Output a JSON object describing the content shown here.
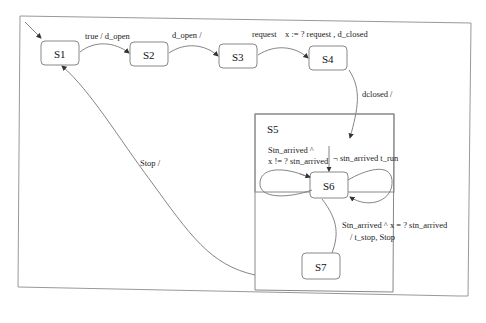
{
  "diagram": {
    "type": "statechart",
    "states": [
      {
        "id": "S1",
        "label": "S1"
      },
      {
        "id": "S2",
        "label": "S2"
      },
      {
        "id": "S3",
        "label": "S3"
      },
      {
        "id": "S4",
        "label": "S4"
      },
      {
        "id": "S5",
        "label": "S5"
      },
      {
        "id": "S6",
        "label": "S6"
      },
      {
        "id": "S7",
        "label": "S7"
      }
    ],
    "transitions": [
      {
        "from": "S1",
        "to": "S2",
        "label": "true / d_open"
      },
      {
        "from": "S2",
        "to": "S3",
        "label": "d_open /"
      },
      {
        "from": "S3",
        "to": "S4",
        "label": "request    x := ? request , d_closed"
      },
      {
        "from": "S4",
        "to": "S5",
        "label": "dclosed /"
      },
      {
        "from": "S5",
        "to": "S1",
        "label": "Stop /"
      },
      {
        "from": "S6",
        "to": "S6",
        "label_line1": "Stn_arrived ^",
        "label_line2": "x != ? stn_arrived"
      },
      {
        "from": "init",
        "to": "S6",
        "label": "¬ stn_arrived t_run"
      },
      {
        "from": "S6",
        "to": "S7",
        "label_line1": "Stn_arrived ^ x = ? stn_arrived",
        "label_line2": "/ t_stop, Stop"
      }
    ]
  }
}
